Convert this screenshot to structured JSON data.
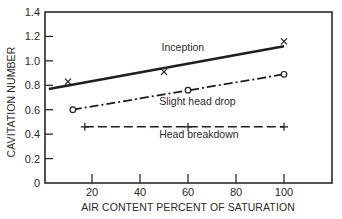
{
  "chart_data": {
    "type": "line",
    "title": "",
    "xlabel": "AIR CONTENT PERCENT OF SATURATION",
    "ylabel": "CAVITATION NUMBER",
    "xlim": [
      0,
      120
    ],
    "ylim": [
      0,
      1.4
    ],
    "xticks": [
      20,
      40,
      60,
      80,
      100
    ],
    "xtick_labels": [
      "20",
      "40",
      "60",
      "80",
      "100"
    ],
    "yticks": [
      0,
      0.2,
      0.4,
      0.6,
      0.8,
      1.0,
      1.2,
      1.4
    ],
    "ytick_labels": [
      "0",
      "0.2",
      "0.4",
      "0.6",
      "0.8",
      "1.0",
      "1.2",
      "1.4"
    ],
    "grid": false,
    "legend_position": "inline labels",
    "series": [
      {
        "name": "Inception",
        "marker": "x",
        "line_style": "solid",
        "points": [
          [
            10,
            0.83
          ],
          [
            50,
            0.91
          ],
          [
            100,
            1.16
          ]
        ],
        "fit_line": [
          [
            2,
            0.77
          ],
          [
            100,
            1.12
          ]
        ],
        "label_pos": [
          49,
          1.08
        ]
      },
      {
        "name": "Slight head drop",
        "marker": "o",
        "line_style": "dashdot",
        "points": [
          [
            12,
            0.6
          ],
          [
            60,
            0.76
          ],
          [
            100,
            0.89
          ]
        ],
        "fit_line": [
          [
            12,
            0.6
          ],
          [
            100,
            0.89
          ]
        ],
        "label_pos": [
          48,
          0.64
        ]
      },
      {
        "name": "Head breakdown",
        "marker": "+",
        "line_style": "dashed",
        "points": [
          [
            17,
            0.46
          ],
          [
            60,
            0.46
          ],
          [
            100,
            0.46
          ]
        ],
        "fit_line": [
          [
            17,
            0.46
          ],
          [
            100,
            0.46
          ]
        ],
        "label_pos": [
          48,
          0.37
        ]
      }
    ]
  }
}
